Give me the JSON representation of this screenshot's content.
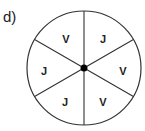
{
  "part_label": "d)",
  "spinner": {
    "center": [
      84,
      68
    ],
    "radius": 57,
    "sector_count": 6,
    "sectors": [
      {
        "label": "J",
        "pos": [
          103,
          40
        ]
      },
      {
        "label": "V",
        "pos": [
          123,
          72
        ]
      },
      {
        "label": "V",
        "pos": [
          103,
          103
        ]
      },
      {
        "label": "J",
        "pos": [
          65,
          103
        ]
      },
      {
        "label": "J",
        "pos": [
          44,
          72
        ]
      },
      {
        "label": "V",
        "pos": [
          66,
          40
        ]
      }
    ],
    "colors": {
      "line": "#333333",
      "center_dot": "#000000",
      "fill": "#ffffff"
    }
  }
}
